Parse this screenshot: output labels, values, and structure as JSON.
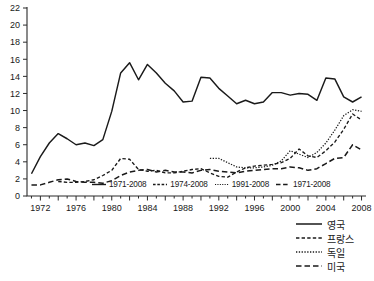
{
  "chart_data": {
    "type": "line",
    "title": "",
    "xlabel": "",
    "ylabel": "",
    "xlim": [
      1970.5,
      2008.5
    ],
    "ylim": [
      0,
      22
    ],
    "grid": false,
    "legend_position": "bottom-right",
    "x_ticks": [
      "1972",
      "1976",
      "1980",
      "1984",
      "1988",
      "1992",
      "1996",
      "2000",
      "2004",
      "2008"
    ],
    "y_ticks": [
      "0",
      "2",
      "4",
      "6",
      "8",
      "10",
      "12",
      "14",
      "16",
      "18",
      "20",
      "22"
    ],
    "series": [
      {
        "name": "영국",
        "range": "1971-2008",
        "style": "solid",
        "x": [
          1971,
          1972,
          1973,
          1974,
          1975,
          1976,
          1977,
          1978,
          1979,
          1980,
          1981,
          1982,
          1983,
          1984,
          1985,
          1986,
          1987,
          1988,
          1989,
          1990,
          1991,
          1992,
          1993,
          1994,
          1995,
          1996,
          1997,
          1998,
          1999,
          2000,
          2001,
          2002,
          2003,
          2004,
          2005,
          2006,
          2007,
          2008
        ],
        "values": [
          2.6,
          4.6,
          6.2,
          7.3,
          6.7,
          6.0,
          6.2,
          5.9,
          6.6,
          9.9,
          14.4,
          15.6,
          13.6,
          15.4,
          14.4,
          13.2,
          12.3,
          11.0,
          11.1,
          13.9,
          13.8,
          12.6,
          11.7,
          10.8,
          11.2,
          10.8,
          11.0,
          12.1,
          12.1,
          11.8,
          12.0,
          11.9,
          11.2,
          13.8,
          13.7,
          11.6,
          11.0,
          11.6
        ]
      },
      {
        "name": "프랑스",
        "range": "1974-2008",
        "style": "dashed",
        "x": [
          1974,
          1975,
          1976,
          1977,
          1978,
          1979,
          1980,
          1981,
          1982,
          1983,
          1984,
          1985,
          1986,
          1987,
          1988,
          1989,
          1990,
          1991,
          1992,
          1993,
          1994,
          1995,
          1996,
          1997,
          1998,
          1999,
          2000,
          2001,
          2002,
          2003,
          2004,
          2005,
          2006,
          2007,
          2008
        ],
        "values": [
          1.7,
          1.6,
          1.6,
          1.7,
          1.9,
          2.4,
          3.0,
          4.4,
          4.3,
          3.1,
          2.9,
          3.0,
          2.7,
          2.7,
          2.9,
          3.1,
          3.2,
          2.7,
          2.3,
          2.2,
          2.8,
          3.3,
          3.5,
          3.6,
          3.7,
          3.9,
          4.4,
          5.5,
          4.7,
          4.5,
          5.3,
          6.3,
          7.8,
          9.6,
          8.9
        ]
      },
      {
        "name": "독일",
        "range": "1991-2008",
        "style": "dotted",
        "x": [
          1991,
          1992,
          1993,
          1994,
          1995,
          1996,
          1997,
          1998,
          1999,
          2000,
          2001,
          2002,
          2003,
          2004,
          2005,
          2006,
          2007,
          2008
        ],
        "values": [
          4.4,
          4.4,
          3.9,
          3.4,
          3.3,
          3.3,
          3.4,
          3.6,
          4.1,
          5.3,
          4.9,
          4.5,
          5.1,
          6.2,
          7.7,
          9.4,
          10.1,
          9.9
        ]
      },
      {
        "name": "미국",
        "range": "1971-2008",
        "style": "long-dash",
        "x": [
          1971,
          1972,
          1973,
          1974,
          1975,
          1976,
          1977,
          1978,
          1979,
          1980,
          1981,
          1982,
          1983,
          1984,
          1985,
          1986,
          1987,
          1988,
          1989,
          1990,
          1991,
          1992,
          1993,
          1994,
          1995,
          1996,
          1997,
          1998,
          1999,
          2000,
          2001,
          2002,
          2003,
          2004,
          2005,
          2006,
          2007,
          2008
        ],
        "values": [
          1.3,
          1.3,
          1.6,
          1.9,
          2.0,
          1.7,
          1.6,
          1.6,
          1.5,
          1.8,
          2.4,
          2.8,
          3.0,
          3.1,
          2.8,
          3.0,
          2.8,
          2.8,
          2.7,
          3.0,
          3.1,
          2.9,
          2.8,
          2.7,
          2.9,
          3.0,
          3.1,
          3.2,
          3.2,
          3.4,
          3.3,
          3.0,
          3.2,
          3.8,
          4.4,
          4.5,
          6.0,
          5.4
        ]
      }
    ]
  },
  "inline_legend": {
    "items": [
      {
        "label": "1971-2008",
        "style": "solid"
      },
      {
        "label": "1974-2008",
        "style": "dashed"
      },
      {
        "label": "1991-2008",
        "style": "dotted"
      },
      {
        "label": "1971-2008",
        "style": "long-dash"
      }
    ]
  },
  "country_legend": {
    "items": [
      {
        "label": "영국",
        "style": "solid"
      },
      {
        "label": "프랑스",
        "style": "dashed"
      },
      {
        "label": "독일",
        "style": "dotted"
      },
      {
        "label": "미국",
        "style": "long-dash"
      }
    ]
  }
}
